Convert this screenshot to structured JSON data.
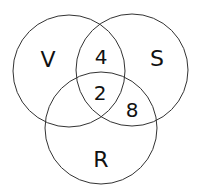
{
  "diagram": {
    "type": "venn",
    "sets": [
      {
        "label": "V",
        "cx": 69,
        "cy": 71,
        "r": 56
      },
      {
        "label": "S",
        "cx": 132,
        "cy": 70,
        "r": 56
      },
      {
        "label": "R",
        "cx": 101,
        "cy": 128,
        "r": 56
      }
    ],
    "regions": [
      {
        "sets": [
          "V",
          "S"
        ],
        "value": "4"
      },
      {
        "sets": [
          "V",
          "S",
          "R"
        ],
        "value": "2"
      },
      {
        "sets": [
          "S",
          "R"
        ],
        "value": "8"
      }
    ],
    "stroke_color": "#333333"
  }
}
